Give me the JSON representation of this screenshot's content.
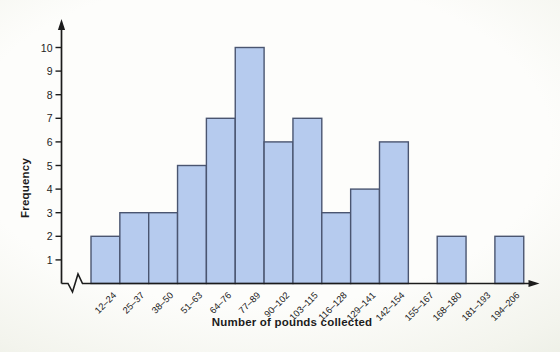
{
  "chart_data": {
    "type": "bar",
    "title": "",
    "xlabel": "Number of pounds collected",
    "ylabel": "Frequency",
    "categories": [
      "12–24",
      "25–37",
      "38–50",
      "51–63",
      "64–76",
      "77–89",
      "90–102",
      "103–115",
      "116–128",
      "129–141",
      "142–154",
      "155–167",
      "168–180",
      "181–193",
      "194–206"
    ],
    "values": [
      2,
      3,
      3,
      5,
      7,
      10,
      6,
      7,
      3,
      4,
      6,
      0,
      2,
      0,
      2
    ],
    "yticks": [
      1,
      2,
      3,
      4,
      5,
      6,
      7,
      8,
      9,
      10
    ],
    "ylim": [
      0,
      10
    ],
    "grid": false,
    "legend": null,
    "axis_break_on_x": true,
    "bar_gap": 0,
    "colors": {
      "bar_fill": "#b6cbee",
      "bar_stroke": "#4a5570",
      "axis": "#1c1c1c",
      "text": "#1c1c1c",
      "background": "#fdfdfb",
      "edge_tint": "#e9ece2"
    }
  }
}
